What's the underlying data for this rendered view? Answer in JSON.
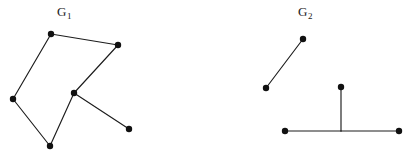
{
  "figure": {
    "width": 417,
    "height": 161,
    "background_color": "#ffffff",
    "ink_color": "#1c1c1c",
    "vertex_color": "#111111",
    "vertex_radius": 3.2,
    "edge_width": 1.15
  },
  "graphs": [
    {
      "id": "G1",
      "label_text": "G",
      "label_subscript": "1",
      "label_position": {
        "x": 57,
        "y": 5
      },
      "vertex_count": 6,
      "edge_count": 6,
      "vertices": [
        {
          "id": "a",
          "name": "top-left",
          "x": 51,
          "y": 34
        },
        {
          "id": "b",
          "name": "top-right",
          "x": 118,
          "y": 45
        },
        {
          "id": "c",
          "name": "center",
          "x": 74,
          "y": 93
        },
        {
          "id": "d",
          "name": "left",
          "x": 13,
          "y": 99
        },
        {
          "id": "e",
          "name": "bottom",
          "x": 50,
          "y": 146
        },
        {
          "id": "f",
          "name": "pendant-lower-right",
          "x": 129,
          "y": 129
        }
      ],
      "edges": [
        {
          "from": "a",
          "to": "b"
        },
        {
          "from": "b",
          "to": "c"
        },
        {
          "from": "c",
          "to": "e"
        },
        {
          "from": "e",
          "to": "d"
        },
        {
          "from": "d",
          "to": "a"
        },
        {
          "from": "c",
          "to": "f"
        }
      ]
    },
    {
      "id": "G2",
      "label_text": "G",
      "label_subscript": "2",
      "label_position": {
        "x": 298,
        "y": 5
      },
      "vertex_count": 5,
      "edge_count": 4,
      "vertices": [
        {
          "id": "p",
          "name": "upper-right-of-segment",
          "x": 303,
          "y": 39
        },
        {
          "id": "q",
          "name": "lower-left-of-segment",
          "x": 266,
          "y": 88
        },
        {
          "id": "r",
          "name": "stem-top",
          "x": 341,
          "y": 87
        },
        {
          "id": "s",
          "name": "bar-left-end",
          "x": 285,
          "y": 131
        },
        {
          "id": "t",
          "name": "bar-right-end",
          "x": 399,
          "y": 131
        }
      ],
      "junctions": [
        {
          "id": "j",
          "name": "stem-bar-junction",
          "x": 341,
          "y": 131
        }
      ],
      "edges": [
        {
          "from": "p",
          "to": "q"
        },
        {
          "from": "r",
          "to": "j"
        },
        {
          "from": "s",
          "to": "j"
        },
        {
          "from": "j",
          "to": "t"
        }
      ]
    }
  ]
}
